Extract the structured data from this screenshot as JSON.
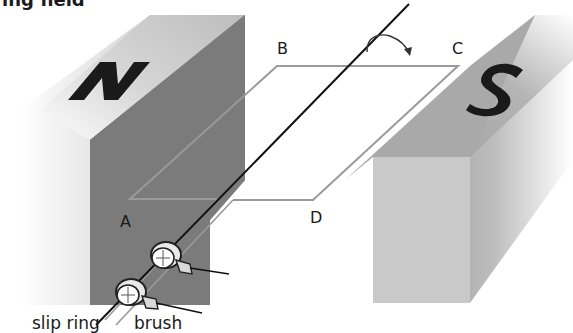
{
  "title_partial": "ing field",
  "diagram": {
    "type": "ac-generator",
    "magnets": {
      "north": {
        "letter": "N",
        "face_color": "#7b7b7b",
        "top_color": "#b9b9b9"
      },
      "south": {
        "letter": "S",
        "face_color": "#c9c9c9",
        "top_color": "#a8a8a8",
        "side_color": "#9a9a9a"
      }
    },
    "coil_corners": {
      "A": "A",
      "B": "B",
      "C": "C",
      "D": "D"
    },
    "labels": {
      "slip_ring": "slip ring",
      "brush": "brush"
    },
    "rotation_arrow": "clockwise-arrow",
    "colors": {
      "coil_line": "#9a9a9a",
      "axle": "#111111",
      "letter": "#1a1a1a"
    }
  }
}
